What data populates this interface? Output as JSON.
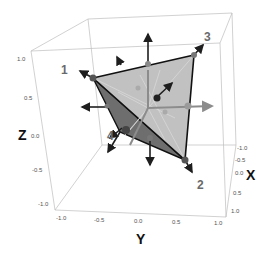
{
  "figure": {
    "colors": {
      "box": "#b8b8b8",
      "face_light": "#b9b9b9",
      "face_dark": "#6e6e6e",
      "edge": "#111111",
      "arrow_dark": "#222222",
      "arrow_gray": "#8a8a8a",
      "vertex_label": "#6a6a6a"
    }
  },
  "axes": {
    "x": {
      "label": "X",
      "ticks": [
        "-1.0",
        "-0.5",
        "0.0",
        "0.5",
        "1.0"
      ]
    },
    "y": {
      "label": "Y",
      "ticks": [
        "-1.0",
        "-0.5",
        "0.0",
        "0.5",
        "1.0"
      ]
    },
    "z": {
      "label": "Z",
      "ticks": [
        "1.0",
        "0.5",
        "0.0",
        "-0.5",
        "-1.0"
      ]
    }
  },
  "vertices": [
    {
      "label": "1"
    },
    {
      "label": "2"
    },
    {
      "label": "3"
    },
    {
      "label": "4"
    }
  ]
}
